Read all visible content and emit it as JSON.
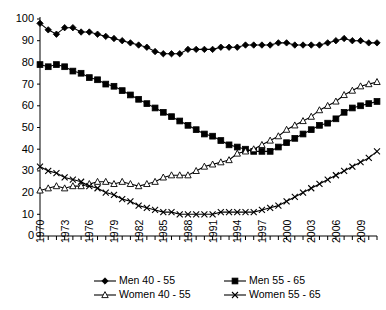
{
  "chart_data": {
    "type": "line",
    "title": "",
    "subtitle": "",
    "xlabel": "",
    "ylabel": "",
    "xlim": [
      1970,
      2011
    ],
    "ylim": [
      0,
      100
    ],
    "grid": false,
    "legend_position": "bottom",
    "y_ticks": [
      0,
      10,
      20,
      30,
      40,
      50,
      60,
      70,
      80,
      90,
      100
    ],
    "x_ticks": [
      1970,
      1973,
      1976,
      1979,
      1982,
      1985,
      1988,
      1991,
      1994,
      1997,
      2000,
      2003,
      2006,
      2009
    ],
    "x": [
      1970,
      1971,
      1972,
      1973,
      1974,
      1975,
      1976,
      1977,
      1978,
      1979,
      1980,
      1981,
      1982,
      1983,
      1984,
      1985,
      1986,
      1987,
      1988,
      1989,
      1990,
      1991,
      1992,
      1993,
      1994,
      1995,
      1996,
      1997,
      1998,
      1999,
      2000,
      2001,
      2002,
      2003,
      2004,
      2005,
      2006,
      2007,
      2008,
      2009,
      2010,
      2011
    ],
    "series": [
      {
        "name": "Men 40 - 55",
        "marker": "filled-diamond",
        "values": [
          98,
          95,
          93,
          96,
          96,
          94,
          94,
          93,
          92,
          91,
          90,
          89,
          88,
          87,
          85,
          84,
          84,
          84,
          86,
          86,
          86,
          86,
          87,
          87,
          87,
          88,
          88,
          88,
          88,
          89,
          89,
          88,
          88,
          88,
          88,
          89,
          90,
          91,
          90,
          90,
          89,
          89
        ]
      },
      {
        "name": "Men 55 - 65",
        "marker": "filled-square",
        "values": [
          79,
          78,
          79,
          78,
          76,
          75,
          73,
          72,
          70,
          69,
          67,
          65,
          63,
          61,
          59,
          57,
          55,
          53,
          51,
          49,
          47,
          46,
          44,
          42,
          41,
          40,
          39,
          39,
          39,
          41,
          43,
          45,
          47,
          49,
          51,
          52,
          54,
          57,
          59,
          60,
          61,
          62
        ]
      },
      {
        "name": "Women 40 - 55",
        "marker": "open-triangle",
        "values": [
          21,
          22,
          23,
          22,
          23,
          23,
          24,
          25,
          25,
          24,
          25,
          24,
          23,
          24,
          25,
          27,
          28,
          28,
          28,
          30,
          32,
          33,
          34,
          35,
          38,
          39,
          40,
          42,
          44,
          46,
          49,
          51,
          53,
          55,
          58,
          60,
          62,
          65,
          67,
          69,
          70,
          71
        ]
      },
      {
        "name": "Women 55 - 65",
        "marker": "cross",
        "values": [
          32,
          30,
          29,
          27,
          26,
          25,
          23,
          22,
          20,
          19,
          17,
          16,
          14,
          13,
          12,
          11,
          11,
          10,
          10,
          10,
          10,
          10,
          11,
          11,
          11,
          11,
          11,
          12,
          13,
          14,
          16,
          18,
          20,
          22,
          24,
          26,
          28,
          30,
          32,
          34,
          36,
          39
        ]
      }
    ]
  },
  "legend": {
    "items": [
      {
        "label": "Men 40 - 55",
        "marker": "filled-diamond"
      },
      {
        "label": "Men 55 - 65",
        "marker": "filled-square"
      },
      {
        "label": "Women 40 - 55",
        "marker": "open-triangle"
      },
      {
        "label": "Women 55 - 65",
        "marker": "cross"
      }
    ]
  }
}
